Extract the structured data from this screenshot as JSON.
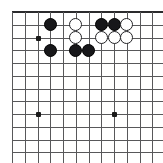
{
  "diagram": {
    "type": "go-board-diagram",
    "board": {
      "colors": {
        "background": "#ffffff",
        "grid_line": "#58585a",
        "border_line": "#2b2b2d",
        "black_stone": "#17171a",
        "white_stone": "#ffffff",
        "white_stone_outline": "#232326",
        "star_point": "#1a1a1a"
      },
      "origin_x": 12,
      "origin_y": 12,
      "spacing": 12.75,
      "columns": 12,
      "rows": 12,
      "edges": {
        "top": true,
        "right": true,
        "left": false,
        "bottom": false
      }
    },
    "star_points": [
      {
        "col": 2,
        "row": 2
      },
      {
        "col": 2,
        "row": 8
      },
      {
        "col": 8,
        "row": 8
      }
    ],
    "stones": [
      {
        "color": "black",
        "col": 3,
        "row": 1
      },
      {
        "color": "white",
        "col": 5,
        "row": 1
      },
      {
        "color": "black",
        "col": 7,
        "row": 1
      },
      {
        "color": "black",
        "col": 8,
        "row": 1
      },
      {
        "color": "white",
        "col": 9,
        "row": 1
      },
      {
        "color": "white",
        "col": 5,
        "row": 2
      },
      {
        "color": "white",
        "col": 7,
        "row": 2
      },
      {
        "color": "white",
        "col": 8,
        "row": 2
      },
      {
        "color": "white",
        "col": 9,
        "row": 2
      },
      {
        "color": "black",
        "col": 3,
        "row": 3
      },
      {
        "color": "black",
        "col": 5,
        "row": 3
      },
      {
        "color": "black",
        "col": 6,
        "row": 3
      }
    ],
    "counts": {
      "black_stones": 6,
      "white_stones": 6,
      "total_stones": 12
    }
  }
}
